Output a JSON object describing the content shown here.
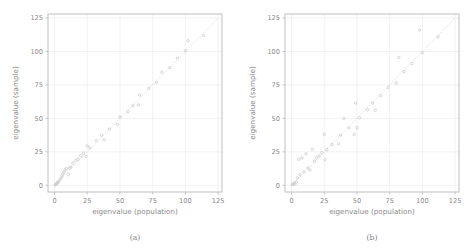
{
  "figure": {
    "background": "#ffffff",
    "axis_color": "#b9b9b9",
    "grid_color": "#ededed",
    "point_color": "#c9c9c9",
    "refline_color": "#d6d6d6",
    "text_color": "#8a8a8a"
  },
  "panels": [
    {
      "caption": "(a)",
      "chart_data": {
        "type": "scatter",
        "title": "",
        "xlabel": "eigenvalue (population)",
        "ylabel": "eigenvalue (sample)",
        "xlim": [
          -5,
          128
        ],
        "ylim": [
          -5,
          128
        ],
        "xticks": [
          0,
          25,
          50,
          75,
          100,
          125
        ],
        "yticks": [
          0,
          25,
          50,
          75,
          100,
          125
        ],
        "xticklabels": [
          "0",
          "25",
          "50",
          "75",
          "100",
          "125"
        ],
        "yticklabels": [
          "0",
          "25",
          "50",
          "75",
          "100",
          "125"
        ],
        "grid": true,
        "legend": "none",
        "reference_line": {
          "type": "identity",
          "from": [
            0,
            0
          ],
          "to": [
            125,
            125
          ],
          "style": "dotted"
        },
        "series": [
          {
            "name": "eigenvalues",
            "marker": "open-circle",
            "points": [
              [
                0.4,
                0.3
              ],
              [
                0.9,
                0.6
              ],
              [
                1.4,
                1.1
              ],
              [
                2.0,
                1.6
              ],
              [
                2.6,
                2.2
              ],
              [
                3.3,
                3.0
              ],
              [
                4.1,
                4.2
              ],
              [
                5.0,
                5.4
              ],
              [
                5.6,
                7.0
              ],
              [
                6.4,
                8.6
              ],
              [
                7.2,
                10.0
              ],
              [
                8.0,
                11.6
              ],
              [
                9.0,
                12.5
              ],
              [
                10.5,
                8.0
              ],
              [
                11.5,
                13.0
              ],
              [
                12.5,
                13.6
              ],
              [
                14.0,
                16.5
              ],
              [
                16.0,
                18.5
              ],
              [
                18.0,
                19.5
              ],
              [
                20.0,
                22.0
              ],
              [
                22.0,
                24.0
              ],
              [
                24.0,
                21.5
              ],
              [
                25.0,
                29.5
              ],
              [
                27.0,
                28.0
              ],
              [
                32.0,
                33.5
              ],
              [
                36.0,
                37.5
              ],
              [
                38.0,
                34.0
              ],
              [
                42.0,
                42.0
              ],
              [
                48.0,
                45.5
              ],
              [
                50.0,
                51.0
              ],
              [
                56.0,
                55.0
              ],
              [
                60.0,
                59.5
              ],
              [
                64.0,
                60.0
              ],
              [
                65.0,
                67.5
              ],
              [
                72.0,
                72.5
              ],
              [
                78.0,
                77.0
              ],
              [
                82.0,
                84.5
              ],
              [
                88.0,
                88.0
              ],
              [
                94.0,
                95.0
              ],
              [
                100.0,
                100.5
              ],
              [
                102.0,
                108.0
              ],
              [
                114.0,
                112.0
              ]
            ]
          }
        ]
      }
    },
    {
      "caption": "(b)",
      "chart_data": {
        "type": "scatter",
        "title": "",
        "xlabel": "eigenvalue (population)",
        "ylabel": "eigenvalue (sample)",
        "xlim": [
          -5,
          128
        ],
        "ylim": [
          -5,
          128
        ],
        "xticks": [
          0,
          25,
          50,
          75,
          100,
          125
        ],
        "yticks": [
          0,
          25,
          50,
          75,
          100,
          125
        ],
        "xticklabels": [
          "0",
          "25",
          "50",
          "75",
          "100",
          "125"
        ],
        "yticklabels": [
          "0",
          "25",
          "50",
          "75",
          "100",
          "125"
        ],
        "grid": true,
        "legend": "none",
        "reference_line": {
          "type": "identity",
          "from": [
            0,
            0
          ],
          "to": [
            125,
            125
          ],
          "style": "dotted"
        },
        "series": [
          {
            "name": "eigenvalues",
            "marker": "open-circle",
            "points": [
              [
                0.5,
                0.4
              ],
              [
                1.2,
                1.0
              ],
              [
                2.0,
                1.6
              ],
              [
                2.5,
                0.8
              ],
              [
                3.5,
                2.5
              ],
              [
                4.5,
                5.5
              ],
              [
                5.5,
                19.5
              ],
              [
                6.5,
                8.0
              ],
              [
                8.0,
                20.5
              ],
              [
                9.5,
                10.0
              ],
              [
                11.0,
                23.5
              ],
              [
                12.5,
                13.0
              ],
              [
                14.0,
                11.5
              ],
              [
                16.0,
                27.0
              ],
              [
                17.5,
                18.0
              ],
              [
                19.0,
                20.5
              ],
              [
                21.0,
                22.0
              ],
              [
                23.0,
                24.5
              ],
              [
                25.0,
                38.0
              ],
              [
                25.5,
                19.0
              ],
              [
                27.0,
                26.5
              ],
              [
                31.0,
                30.5
              ],
              [
                36.0,
                31.0
              ],
              [
                37.5,
                37.5
              ],
              [
                40.0,
                50.0
              ],
              [
                44.0,
                43.0
              ],
              [
                48.0,
                38.0
              ],
              [
                49.0,
                61.5
              ],
              [
                50.0,
                43.0
              ],
              [
                52.0,
                50.5
              ],
              [
                58.0,
                56.5
              ],
              [
                62.0,
                61.5
              ],
              [
                64.0,
                56.0
              ],
              [
                68.0,
                67.0
              ],
              [
                74.0,
                73.0
              ],
              [
                80.0,
                76.5
              ],
              [
                82.0,
                95.5
              ],
              [
                86.0,
                85.0
              ],
              [
                92.0,
                91.0
              ],
              [
                98.0,
                116.0
              ],
              [
                100.0,
                99.0
              ],
              [
                112.0,
                111.0
              ]
            ]
          }
        ]
      }
    }
  ]
}
